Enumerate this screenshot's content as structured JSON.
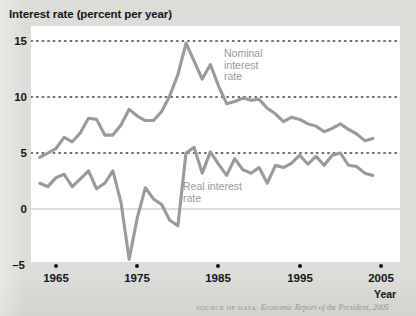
{
  "figure": {
    "title": "Interest rate (percent per year)",
    "xaxis_name": "Year",
    "source": "Economic Report of the President, 2005",
    "source_prefix": "SOURCE OF DATA:"
  },
  "labels": {
    "nominal_line1": "Nominal",
    "nominal_line2": "interest",
    "nominal_line3": "rate",
    "real_line1": "Real interest",
    "real_line2": "rate"
  },
  "colors": {
    "line": "#9a9a9a",
    "plot_bg": "#ffffff",
    "page_bg": "#dcdcd8",
    "text": "#15151a",
    "gridline": "#3a3a3a",
    "zeroline": "#bdbdbd"
  },
  "chart_data": {
    "type": "line",
    "title": "Interest rate (percent per year)",
    "xlabel": "Year",
    "ylabel": "Interest rate (percent per year)",
    "xlim": [
      1963,
      2005
    ],
    "ylim": [
      -5,
      15
    ],
    "grid": true,
    "gridlines_y": [
      5,
      10,
      15
    ],
    "zero_line": 0,
    "legend": "inline-annotations",
    "xticks": [
      1965,
      1975,
      1985,
      1995,
      2005
    ],
    "yticks": [
      -5,
      0,
      5,
      10,
      15
    ],
    "x": [
      1963,
      1964,
      1965,
      1966,
      1967,
      1968,
      1969,
      1970,
      1971,
      1972,
      1973,
      1974,
      1975,
      1976,
      1977,
      1978,
      1979,
      1980,
      1981,
      1982,
      1983,
      1984,
      1985,
      1986,
      1987,
      1988,
      1989,
      1990,
      1991,
      1992,
      1993,
      1994,
      1995,
      1996,
      1997,
      1998,
      1999,
      2000,
      2001,
      2002,
      2003,
      2004
    ],
    "series": [
      {
        "name": "Nominal interest rate",
        "values": [
          4.6,
          5.0,
          5.4,
          6.4,
          6.0,
          6.8,
          8.1,
          8.0,
          6.6,
          6.6,
          7.5,
          8.9,
          8.3,
          7.9,
          7.9,
          8.7,
          10.1,
          12.0,
          14.8,
          13.2,
          11.6,
          12.9,
          11.0,
          9.4,
          9.6,
          9.9,
          9.7,
          9.8,
          9.0,
          8.5,
          7.8,
          8.2,
          8.0,
          7.6,
          7.4,
          6.9,
          7.2,
          7.6,
          7.1,
          6.7,
          6.1,
          6.3
        ]
      },
      {
        "name": "Real interest rate",
        "values": [
          2.3,
          2.0,
          2.8,
          3.1,
          2.0,
          2.7,
          3.4,
          1.8,
          2.3,
          3.4,
          0.6,
          -4.5,
          -0.8,
          1.9,
          0.9,
          0.4,
          -1.0,
          -1.5,
          5.0,
          5.5,
          3.2,
          5.1,
          4.0,
          3.0,
          4.5,
          3.5,
          3.2,
          3.7,
          2.3,
          3.9,
          3.7,
          4.1,
          4.8,
          4.0,
          4.7,
          3.9,
          4.8,
          5.0,
          3.9,
          3.8,
          3.2,
          3.0
        ]
      }
    ]
  }
}
